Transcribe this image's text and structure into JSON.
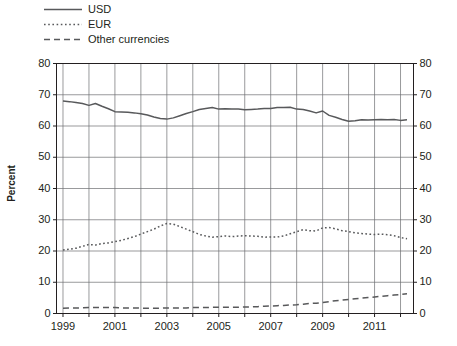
{
  "legend": {
    "position": "top-left",
    "entries": [
      {
        "label": "USD",
        "style": "solid",
        "color": "#58595b",
        "name": "legend-item-usd"
      },
      {
        "label": "EUR",
        "style": "dotted",
        "color": "#58595b",
        "name": "legend-item-eur"
      },
      {
        "label": "Other currencies",
        "style": "dashed",
        "color": "#58595b",
        "name": "legend-item-other"
      }
    ]
  },
  "axis": {
    "ylabel": "Percent",
    "yticks": [
      "0",
      "10",
      "20",
      "30",
      "40",
      "50",
      "60",
      "70",
      "80"
    ],
    "yticks_right": [
      "0",
      "10",
      "20",
      "30",
      "40",
      "50",
      "60",
      "70",
      "80"
    ],
    "xticks": [
      "1999",
      "2001",
      "2003",
      "2005",
      "2007",
      "2009",
      "2011"
    ]
  },
  "colors": {
    "line": "#58595b",
    "grid": "#6d6e71",
    "axis": "#231f20",
    "background": "#ffffff"
  },
  "chart_data": {
    "type": "line",
    "title": "",
    "xlabel": "",
    "ylabel": "Percent",
    "ylim": [
      0,
      80
    ],
    "xlim": [
      1998.75,
      2012.5
    ],
    "grid": true,
    "legend_position": "top-left",
    "xticks": [
      1999,
      2001,
      2003,
      2005,
      2007,
      2009,
      2011
    ],
    "yticks": [
      0,
      10,
      20,
      30,
      40,
      50,
      60,
      70,
      80
    ],
    "x": [
      1999.0,
      1999.25,
      1999.5,
      1999.75,
      2000.0,
      2000.25,
      2000.5,
      2000.75,
      2001.0,
      2001.25,
      2001.5,
      2001.75,
      2002.0,
      2002.25,
      2002.5,
      2002.75,
      2003.0,
      2003.25,
      2003.5,
      2003.75,
      2004.0,
      2004.25,
      2004.5,
      2004.75,
      2005.0,
      2005.25,
      2005.5,
      2005.75,
      2006.0,
      2006.25,
      2006.5,
      2006.75,
      2007.0,
      2007.25,
      2007.5,
      2007.75,
      2008.0,
      2008.25,
      2008.5,
      2008.75,
      2009.0,
      2009.25,
      2009.5,
      2009.75,
      2010.0,
      2010.25,
      2010.5,
      2010.75,
      2011.0,
      2011.25,
      2011.5,
      2011.75,
      2012.0,
      2012.25
    ],
    "series": [
      {
        "name": "USD",
        "style": "solid",
        "color": "#58595b",
        "values": [
          68.0,
          67.8,
          67.5,
          67.2,
          66.6,
          67.2,
          66.3,
          65.5,
          64.6,
          64.5,
          64.4,
          64.2,
          63.9,
          63.5,
          62.9,
          62.4,
          62.2,
          62.6,
          63.3,
          64.0,
          64.6,
          65.3,
          65.6,
          65.9,
          65.4,
          65.5,
          65.4,
          65.4,
          65.2,
          65.3,
          65.4,
          65.6,
          65.6,
          65.9,
          65.9,
          66.0,
          65.4,
          65.3,
          64.8,
          64.2,
          64.8,
          63.4,
          62.8,
          62.1,
          61.5,
          61.7,
          62.0,
          61.9,
          62.0,
          62.1,
          62.0,
          62.1,
          61.8,
          62.0
        ]
      },
      {
        "name": "EUR",
        "style": "dotted",
        "color": "#58595b",
        "values": [
          20.3,
          20.6,
          20.9,
          21.5,
          22.1,
          21.9,
          22.4,
          22.6,
          23.0,
          23.4,
          24.0,
          24.6,
          25.4,
          26.2,
          27.0,
          28.0,
          28.8,
          28.6,
          27.8,
          27.0,
          26.2,
          25.3,
          24.8,
          24.4,
          24.6,
          24.8,
          24.6,
          24.8,
          24.9,
          24.8,
          24.7,
          24.4,
          24.5,
          24.5,
          24.8,
          25.5,
          26.2,
          26.8,
          26.5,
          26.4,
          27.4,
          27.5,
          27.1,
          26.5,
          26.2,
          25.8,
          25.6,
          25.4,
          25.3,
          25.4,
          25.2,
          24.9,
          24.3,
          23.9
        ]
      },
      {
        "name": "Other currencies",
        "style": "dashed",
        "color": "#58595b",
        "values": [
          1.7,
          1.8,
          1.8,
          1.8,
          1.9,
          1.9,
          1.9,
          1.9,
          1.9,
          1.8,
          1.8,
          1.8,
          1.7,
          1.7,
          1.7,
          1.7,
          1.8,
          1.8,
          1.8,
          1.8,
          1.9,
          1.9,
          1.9,
          2.0,
          2.0,
          2.0,
          2.0,
          2.0,
          2.1,
          2.1,
          2.2,
          2.3,
          2.4,
          2.5,
          2.6,
          2.7,
          2.8,
          3.0,
          3.2,
          3.3,
          3.5,
          3.8,
          4.1,
          4.3,
          4.5,
          4.7,
          4.9,
          5.1,
          5.3,
          5.5,
          5.7,
          5.9,
          6.1,
          6.3
        ]
      }
    ]
  }
}
